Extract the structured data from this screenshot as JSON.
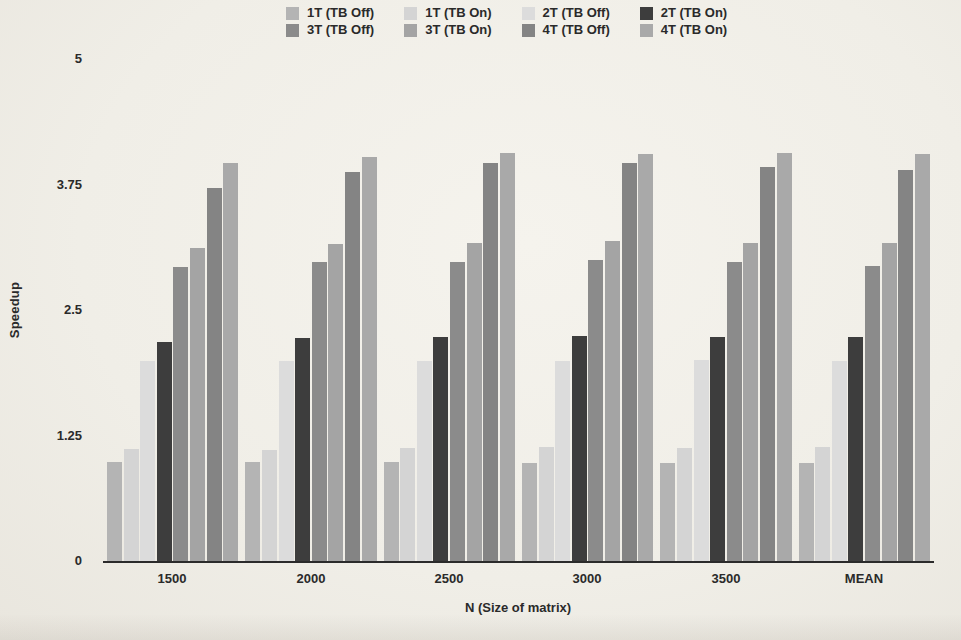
{
  "page": {
    "background": "#f0eee7",
    "text_color": "#2a2a2a"
  },
  "chart_data": {
    "type": "bar",
    "title": "",
    "xlabel": "N (Size of matrix)",
    "ylabel": "Speedup",
    "categories": [
      "1500",
      "2000",
      "2500",
      "3000",
      "3500",
      "MEAN"
    ],
    "ylim": [
      0,
      5
    ],
    "yticks": [
      {
        "label": "0",
        "value": 0
      },
      {
        "label": "1.25",
        "value": 1.25
      },
      {
        "label": "2.5",
        "value": 2.5
      },
      {
        "label": "3.75",
        "value": 3.75
      },
      {
        "label": "5",
        "value": 5
      }
    ],
    "grid": false,
    "legend_position": "top-center",
    "legend_rows": 2,
    "legend_columns": 4,
    "series": [
      {
        "name": "1T (TB Off)",
        "color": "#b4b4b4",
        "values": [
          0.99,
          0.99,
          0.99,
          0.98,
          0.98,
          0.98
        ]
      },
      {
        "name": "1T (TB On)",
        "color": "#d4d4d4",
        "values": [
          1.12,
          1.11,
          1.13,
          1.14,
          1.13,
          1.14
        ]
      },
      {
        "name": "2T (TB Off)",
        "color": "#dcdcdc",
        "values": [
          1.99,
          1.99,
          1.99,
          1.99,
          2.0,
          1.99
        ]
      },
      {
        "name": "2T (TB On)",
        "color": "#3d3d3d",
        "values": [
          2.18,
          2.22,
          2.23,
          2.24,
          2.23,
          2.23
        ]
      },
      {
        "name": "3T (TB Off)",
        "color": "#8b8b8b",
        "values": [
          2.93,
          2.98,
          2.98,
          3.0,
          2.98,
          2.94
        ]
      },
      {
        "name": "3T (TB On)",
        "color": "#a4a4a4",
        "values": [
          3.12,
          3.16,
          3.17,
          3.19,
          3.17,
          3.17
        ]
      },
      {
        "name": "4T (TB Off)",
        "color": "#848484",
        "values": [
          3.72,
          3.87,
          3.96,
          3.96,
          3.92,
          3.89
        ]
      },
      {
        "name": "4T (TB On)",
        "color": "#a9a9a9",
        "values": [
          3.96,
          4.02,
          4.06,
          4.05,
          4.06,
          4.05
        ]
      }
    ]
  }
}
